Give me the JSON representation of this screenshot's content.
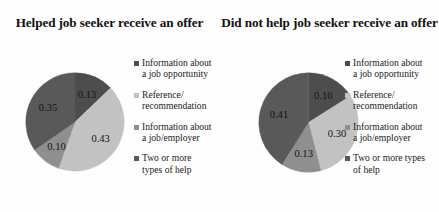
{
  "figure": {
    "caption_type": "two-panel grayscale pie chart figure"
  },
  "panels": [
    {
      "title": "Helped job seeker receive\nan offer",
      "legend": [
        {
          "label": "Information about\na job opportunity",
          "color": "#4d4d4d"
        },
        {
          "label": "Reference/\nrecommendation",
          "color": "#c2c2c2"
        },
        {
          "label": "Information about\na job/employer",
          "color": "#8f8f8f"
        },
        {
          "label": "Two or more\ntypes of help",
          "color": "#595959"
        }
      ]
    },
    {
      "title": "Did not help job seeker\nreceive an offer",
      "legend": [
        {
          "label": "Information about\na job opportunity",
          "color": "#4d4d4d"
        },
        {
          "label": "Reference/\nrecommendation",
          "color": "#c2c2c2"
        },
        {
          "label": "Information about\na job/employer",
          "color": "#8f8f8f"
        },
        {
          "label": "Two or more types\nof help",
          "color": "#595959"
        }
      ]
    }
  ],
  "chart_data": [
    {
      "type": "pie",
      "title": "Helped job seeker receive an offer",
      "categories": [
        "Information about a job opportunity",
        "Reference/recommendation",
        "Information about a job/employer",
        "Two or more types of help"
      ],
      "values": [
        0.13,
        0.43,
        0.1,
        0.35
      ],
      "labels": [
        "0.13",
        "0.43",
        "0.10",
        "0.35"
      ],
      "colors": [
        "#4d4d4d",
        "#c2c2c2",
        "#8f8f8f",
        "#595959"
      ],
      "start_angle_deg": 0,
      "direction": "clockwise",
      "legend_position": "right",
      "grid": false
    },
    {
      "type": "pie",
      "title": "Did not help job seeker receive an offer",
      "categories": [
        "Information about a job opportunity",
        "Reference/recommendation",
        "Information about a job/employer",
        "Two or more types of help"
      ],
      "values": [
        0.16,
        0.3,
        0.13,
        0.41
      ],
      "labels": [
        "0.16",
        "0.30",
        "0.13",
        "0.41"
      ],
      "colors": [
        "#4d4d4d",
        "#c2c2c2",
        "#8f8f8f",
        "#595959"
      ],
      "start_angle_deg": 0,
      "direction": "clockwise",
      "legend_position": "right",
      "grid": false
    }
  ]
}
